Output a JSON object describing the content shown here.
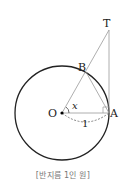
{
  "diagram": {
    "points": {
      "O": {
        "label": "O"
      },
      "A": {
        "label": "A"
      },
      "B": {
        "label": "B"
      },
      "T": {
        "label": "T"
      }
    },
    "angle_label": "x",
    "radius_label": "1",
    "caption": "[반지름 1인 원]"
  },
  "colors": {
    "stroke": "#222222",
    "thin_stroke": "#888888",
    "caption": "#777777"
  }
}
